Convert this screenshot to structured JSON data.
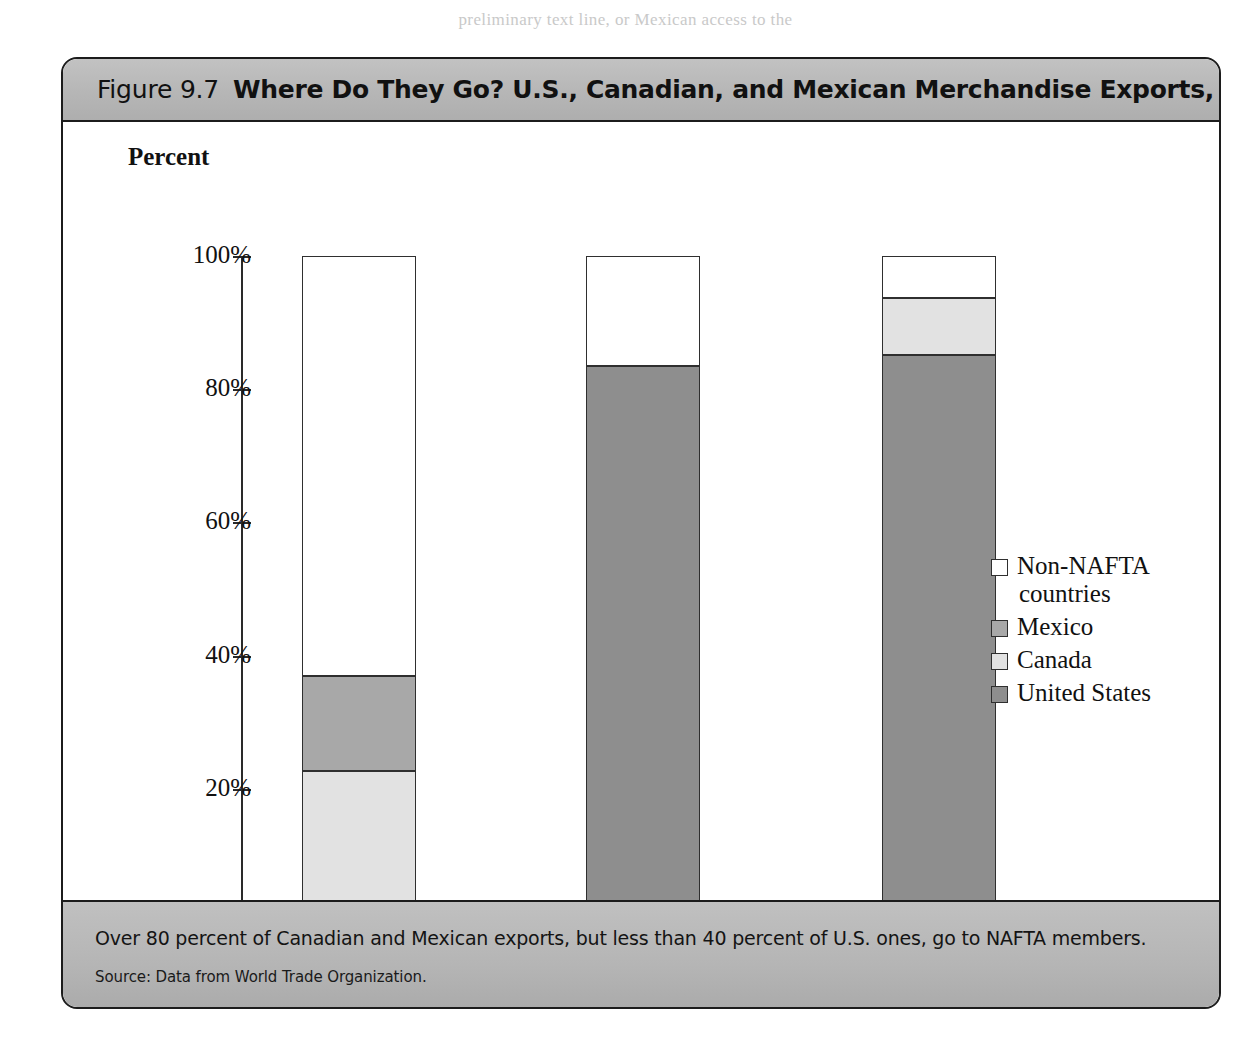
{
  "page_top_text": "preliminary text line, or Mexican access to the",
  "figure": {
    "number_label": "Figure 9.7",
    "title": "Where Do They Go? U.S., Canadian, and Mexican Merchandise Exports, 2000",
    "footer_note": "Over 80 percent of Canadian and Mexican exports, but less than 40 percent of U.S. ones, go to NAFTA members.",
    "source": "Source: Data from World Trade Organization."
  },
  "colors": {
    "non_nafta": "#ffffff",
    "mexico": "#a8a8a8",
    "canada": "#e2e2e2",
    "united_states": "#8e8e8e",
    "band": "#b6b6b6",
    "outline": "#2f2f2f"
  },
  "chart_data": {
    "type": "bar",
    "stacked": true,
    "title": "Where Do They Go? U.S., Canadian, and Mexican Merchandise Exports, 2000",
    "xlabel": "",
    "ylabel": "Percent",
    "ylim": [
      0,
      100
    ],
    "yticks": [
      "0%",
      "20%",
      "40%",
      "60%",
      "80%",
      "100%"
    ],
    "ytick_values": [
      0,
      20,
      40,
      60,
      80,
      100
    ],
    "grid": false,
    "legend_position": "right",
    "categories": [
      "Share of U.S. exports",
      "Share of Canadian exports",
      "Share of Mexican exports"
    ],
    "series": [
      {
        "name": "United States",
        "values": [
          0,
          83.5,
          85.1
        ]
      },
      {
        "name": "Canada",
        "values": [
          22.7,
          0,
          8.6
        ]
      },
      {
        "name": "Mexico",
        "values": [
          14.2,
          0,
          0
        ]
      },
      {
        "name": "Non-NAFTA countries",
        "values": [
          63.1,
          16.5,
          6.3
        ]
      }
    ],
    "legend": [
      {
        "label_line1": "Non-NAFTA",
        "label_line2": "countries",
        "color": "#ffffff"
      },
      {
        "label_line1": "Mexico",
        "label_line2": "",
        "color": "#a8a8a8"
      },
      {
        "label_line1": "Canada",
        "label_line2": "",
        "color": "#e2e2e2"
      },
      {
        "label_line1": "United States",
        "label_line2": "",
        "color": "#8e8e8e"
      }
    ]
  }
}
